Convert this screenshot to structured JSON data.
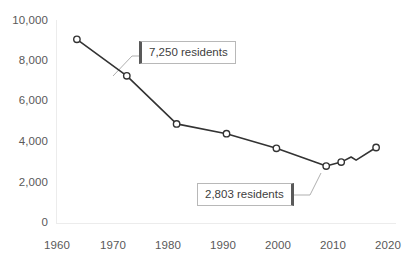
{
  "chart_data": {
    "type": "line",
    "title": "",
    "xlabel": "",
    "ylabel": "",
    "xlim": [
      1956,
      2024
    ],
    "ylim": [
      0,
      10000
    ],
    "grid": false,
    "legend": null,
    "x": [
      1960,
      1970,
      1980,
      1990,
      2000,
      2010,
      2013,
      2015,
      2016,
      2020
    ],
    "values": [
      9050,
      7250,
      4880,
      4400,
      3680,
      2803,
      3000,
      3250,
      3100,
      3720
    ],
    "series": [
      {
        "name": "Residents",
        "x": [
          1960,
          1970,
          1980,
          1990,
          2000,
          2010,
          2013,
          2015,
          2016,
          2020
        ],
        "values": [
          9050,
          7250,
          4880,
          4400,
          3680,
          2803,
          3000,
          3250,
          3100,
          3720
        ]
      }
    ],
    "markers": [
      {
        "x": 1960,
        "y": 9050,
        "marked": true
      },
      {
        "x": 1970,
        "y": 7250,
        "marked": true
      },
      {
        "x": 1980,
        "y": 4880,
        "marked": true
      },
      {
        "x": 1990,
        "y": 4400,
        "marked": true
      },
      {
        "x": 2000,
        "y": 3680,
        "marked": true
      },
      {
        "x": 2010,
        "y": 2803,
        "marked": true
      },
      {
        "x": 2013,
        "y": 3000,
        "marked": true
      },
      {
        "x": 2015,
        "y": 3250,
        "marked": false
      },
      {
        "x": 2016,
        "y": 3100,
        "marked": false
      },
      {
        "x": 2020,
        "y": 3720,
        "marked": true
      }
    ],
    "yticks": [
      {
        "value": 10000,
        "label": "10,000"
      },
      {
        "value": 8000,
        "label": "8,000"
      },
      {
        "value": 6000,
        "label": "6,000"
      },
      {
        "value": 4000,
        "label": "4,000"
      },
      {
        "value": 2000,
        "label": "2,000"
      },
      {
        "value": 0,
        "label": "0"
      }
    ],
    "xticks": [
      {
        "value": 1960,
        "label": "1960"
      },
      {
        "value": 1970,
        "label": "1970"
      },
      {
        "value": 1980,
        "label": "1980"
      },
      {
        "value": 1990,
        "label": "1990"
      },
      {
        "value": 2000,
        "label": "2000"
      },
      {
        "value": 2010,
        "label": "2010"
      },
      {
        "value": 2020,
        "label": "2020"
      }
    ],
    "annotations": [
      {
        "id": "callout-1970",
        "text": "7,250 residents",
        "points_to_x": 1970,
        "points_to_y": 7250,
        "accent_side": "left"
      },
      {
        "id": "callout-2010",
        "text": "2,803 residents",
        "points_to_x": 2010,
        "points_to_y": 2803,
        "accent_side": "right"
      }
    ],
    "colors": {
      "line": "#404040",
      "marker_fill": "#ffffff",
      "marker_stroke": "#404040",
      "axis": "#e8e8e8",
      "tick_text": "#595959",
      "callout_border": "#b8b8b8",
      "callout_accent": "#595959",
      "leader_line": "#a6a6a6",
      "background": "#ffffff"
    }
  }
}
